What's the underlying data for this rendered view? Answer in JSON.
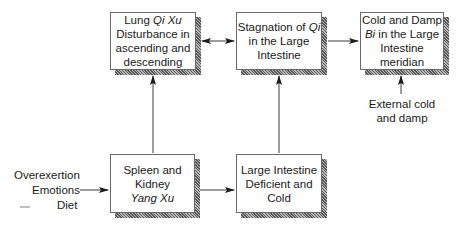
{
  "diagram": {
    "boxes": [
      {
        "id": "lung-qi-xu",
        "lines": [
          [
            "Lung ",
            {
              "i": "Qi Xu"
            }
          ],
          [
            "Disturbance in"
          ],
          [
            "ascending and"
          ],
          [
            "descending"
          ]
        ]
      },
      {
        "id": "stagnation-qi",
        "lines": [
          [
            "Stagnation of ",
            {
              "i": "Qi"
            }
          ],
          [
            "in the Large"
          ],
          [
            "Intestine"
          ]
        ]
      },
      {
        "id": "cold-damp-bi",
        "lines": [
          [
            "Cold and Damp"
          ],
          [
            {
              "i": "Bi"
            },
            " in the Large"
          ],
          [
            "Intestine"
          ],
          [
            "meridian"
          ]
        ]
      },
      {
        "id": "spleen-kidney-yang-xu",
        "lines": [
          [
            "Spleen and"
          ],
          [
            "Kidney"
          ],
          [
            {
              "i": "Yang Xu"
            }
          ]
        ]
      },
      {
        "id": "large-intestine-deficient-cold",
        "lines": [
          [
            "Large Intestine"
          ],
          [
            "Deficient and"
          ],
          [
            "Cold"
          ]
        ]
      }
    ],
    "box_text": {
      "lung_line1": "Lung ",
      "lung_line1_i": "Qi Xu",
      "lung_line2": "Disturbance in",
      "lung_line3": "ascending and",
      "lung_line4": "descending",
      "stag_line1": "Stagnation of ",
      "stag_line1_i": "Qi",
      "stag_line2": "in the Large",
      "stag_line3": "Intestine",
      "cold_line1": "Cold and Damp",
      "cold_line2_i": "Bi",
      "cold_line2": " in the Large",
      "cold_line3": "Intestine",
      "cold_line4": "meridian",
      "spleen_line1": "Spleen and",
      "spleen_line2": "Kidney",
      "spleen_line3_i": "Yang Xu",
      "li_line1": "Large Intestine",
      "li_line2": "Deficient and",
      "li_line3": "Cold"
    },
    "causes": [
      "Overexertion",
      "Emotions",
      "Diet"
    ],
    "external": [
      "External cold",
      "and damp"
    ],
    "edges": [
      {
        "from": "causes",
        "to": "spleen-kidney-yang-xu",
        "type": "arrow"
      },
      {
        "from": "spleen-kidney-yang-xu",
        "to": "large-intestine-deficient-cold",
        "type": "arrow"
      },
      {
        "from": "spleen-kidney-yang-xu",
        "to": "lung-qi-xu",
        "type": "arrow"
      },
      {
        "from": "large-intestine-deficient-cold",
        "to": "stagnation-qi",
        "type": "arrow"
      },
      {
        "from": "lung-qi-xu",
        "to": "stagnation-qi",
        "type": "bidirectional"
      },
      {
        "from": "stagnation-qi",
        "to": "cold-damp-bi",
        "type": "arrow"
      },
      {
        "from": "external",
        "to": "cold-damp-bi",
        "type": "arrow"
      }
    ]
  }
}
